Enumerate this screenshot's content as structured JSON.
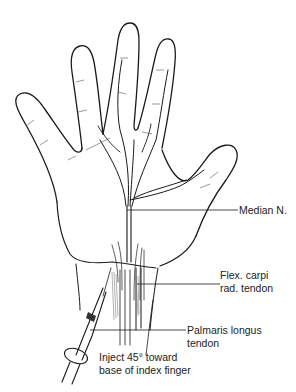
{
  "figure": {
    "labels": {
      "median_nerve": "Median N.",
      "flex_carpi_line1": "Flex. carpi",
      "flex_carpi_line2": "rad. tendon",
      "palmaris_line1": "Palmaris longus",
      "palmaris_line2": "tendon",
      "inject_line1": "Inject 45° toward",
      "inject_line2": "base of index finger"
    },
    "colors": {
      "line": "#1a1a1a",
      "text": "#222222",
      "background": "#ffffff"
    }
  }
}
